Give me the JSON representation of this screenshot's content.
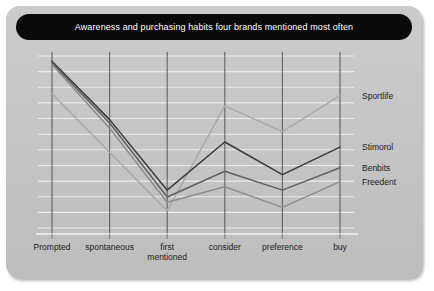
{
  "title": "Awareness and purchasing habits four brands mentioned most often",
  "colors": {
    "panel": "#c6c6c6",
    "titlebar": "#0a0a0a",
    "title_text": "#ffffff",
    "gridline_horizontal": "#efefef",
    "gridline_vertical": "#585858",
    "axis": "#4a4a4a",
    "sportlife": "#a9a9a9",
    "stimorol": "#3a3a3a",
    "benbits": "#606060",
    "freedent": "#8d8d8d"
  },
  "chart_data": {
    "type": "line",
    "title": "Awareness and purchasing habits four brands mentioned most often",
    "xlabel": "",
    "ylabel": "",
    "grid": true,
    "legend_position": "right-inline",
    "ylim": [
      0,
      100
    ],
    "categories": [
      "Prompted",
      "spontaneous",
      "first mentioned",
      "consider",
      "preference",
      "buy"
    ],
    "category_labels": [
      {
        "line1": "Prompted",
        "line2": ""
      },
      {
        "line1": "spontaneous",
        "line2": ""
      },
      {
        "line1": "first",
        "line2": "mentioned"
      },
      {
        "line1": "consider",
        "line2": ""
      },
      {
        "line1": "preference",
        "line2": ""
      },
      {
        "line1": "buy",
        "line2": ""
      }
    ],
    "series": [
      {
        "name": "Sportlife",
        "color": "#a9a9a9",
        "values": [
          78,
          44,
          10,
          71,
          56,
          77
        ]
      },
      {
        "name": "Stimorol",
        "color": "#3a3a3a",
        "values": [
          97,
          63,
          22,
          50,
          31,
          47
        ]
      },
      {
        "name": "Benbits",
        "color": "#606060",
        "values": [
          96,
          61,
          18,
          33,
          22,
          35
        ]
      },
      {
        "name": "Freedent",
        "color": "#8d8d8d",
        "values": [
          95,
          58,
          15,
          24,
          12,
          27
        ]
      }
    ]
  },
  "series_labels": [
    {
      "name": "Sportlife"
    },
    {
      "name": "Stimorol"
    },
    {
      "name": "Benbits"
    },
    {
      "name": "Freedent"
    }
  ]
}
